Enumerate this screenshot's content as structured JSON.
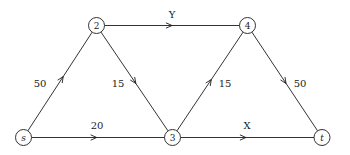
{
  "diagram": {
    "type": "flow-network",
    "title": "",
    "canvas": {
      "width": 350,
      "height": 155,
      "background": "#ffffff"
    },
    "line_color": "#1c1c1c",
    "nodes": [
      {
        "id": "s",
        "label": "s",
        "style": "italic",
        "x": 23.5,
        "y": 137.5,
        "r": 8
      },
      {
        "id": "2",
        "label": "2",
        "style": "upright",
        "x": 96.5,
        "y": 25.5,
        "r": 8
      },
      {
        "id": "3",
        "label": "3",
        "style": "upright",
        "x": 172.5,
        "y": 137.5,
        "r": 8
      },
      {
        "id": "4",
        "label": "4",
        "style": "upright",
        "x": 247.5,
        "y": 25.5,
        "r": 8
      },
      {
        "id": "t",
        "label": "t",
        "style": "italic",
        "x": 322.0,
        "y": 137.5,
        "r": 8
      }
    ],
    "edges": [
      {
        "id": "s-2",
        "from": "s",
        "to": "2",
        "label": "50",
        "label_x": 40,
        "label_y": 83,
        "arrow_t": 0.55
      },
      {
        "id": "2-4",
        "from": "2",
        "to": "4",
        "label": "Y",
        "label_x": 172,
        "label_y": 14,
        "arrow_t": 0.5
      },
      {
        "id": "2-3",
        "from": "2",
        "to": "3",
        "label": "15",
        "label_x": 118,
        "label_y": 83,
        "arrow_t": 0.52
      },
      {
        "id": "s-3",
        "from": "s",
        "to": "3",
        "label": "20",
        "label_x": 97,
        "label_y": 125,
        "arrow_t": 0.49
      },
      {
        "id": "3-4",
        "from": "3",
        "to": "4",
        "label": "15",
        "label_x": 225,
        "label_y": 83,
        "arrow_t": 0.52
      },
      {
        "id": "4-t",
        "from": "4",
        "to": "t",
        "label": "50",
        "label_x": 300,
        "label_y": 83,
        "arrow_t": 0.52
      },
      {
        "id": "3-t",
        "from": "3",
        "to": "t",
        "label": "X",
        "label_x": 247,
        "label_y": 125,
        "arrow_t": 0.49
      }
    ]
  }
}
